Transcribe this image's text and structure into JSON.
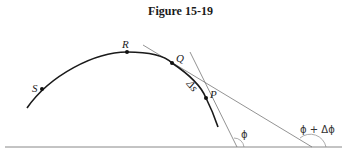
{
  "figure": {
    "title": "Figure 15-19",
    "points": [
      {
        "name": "S",
        "label": "S"
      },
      {
        "name": "R",
        "label": "R"
      },
      {
        "name": "Q",
        "label": "Q"
      },
      {
        "name": "P",
        "label": "P"
      }
    ],
    "arc_label": "Δs",
    "angle_labels": {
      "phi": "ϕ",
      "phi_plus_delta": "ϕ + Δϕ"
    },
    "colors": {
      "curve": "#1a1a1a",
      "tangent": "#777777",
      "baseline": "#888888"
    }
  }
}
